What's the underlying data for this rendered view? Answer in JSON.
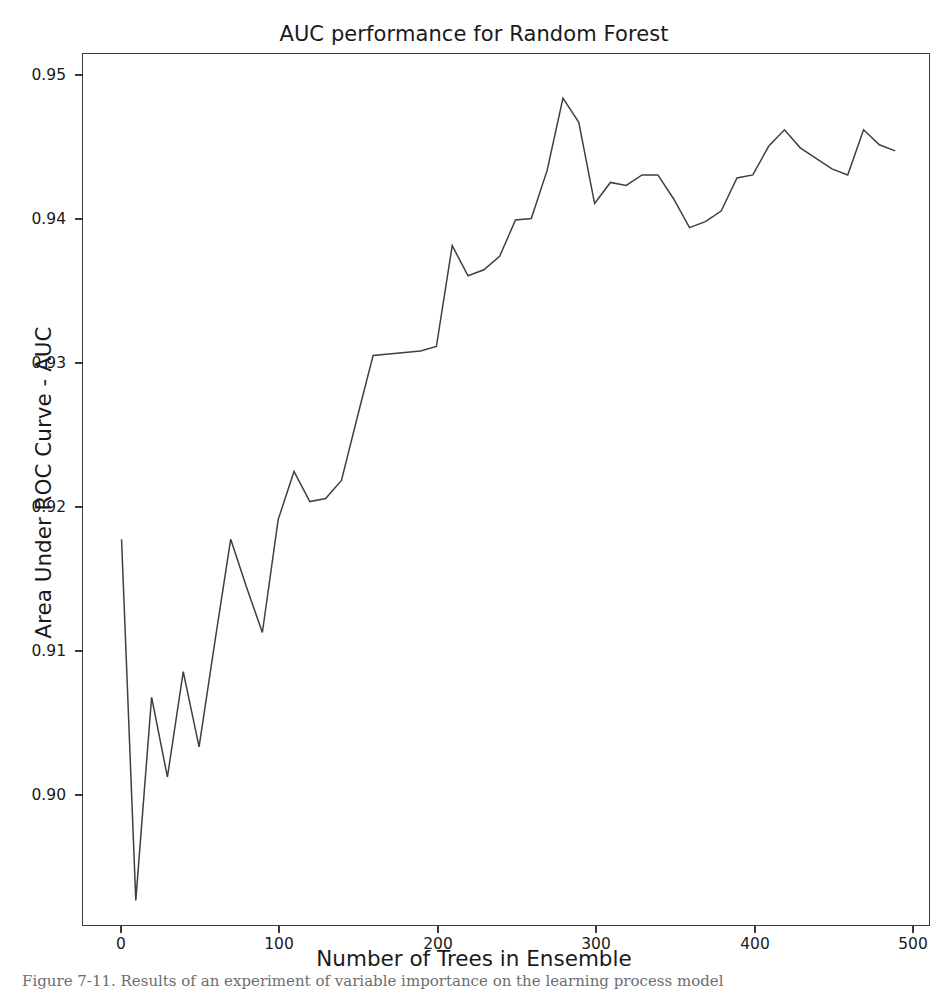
{
  "figure": {
    "title": "AUC performance for Random Forest",
    "background_color": "#ffffff",
    "line_color": "#3f3f3f",
    "axis_color": "#3a3a3a",
    "text_color": "#1a1a1a"
  },
  "chart_data": {
    "type": "line",
    "title": "AUC performance for Random Forest",
    "xlabel": "Number of Trees in Ensemble",
    "ylabel": "Area Under ROC Curve - AUC",
    "xlim": [
      -24,
      512
    ],
    "ylim": [
      0.8938,
      0.9518
    ],
    "xticks": [
      0,
      100,
      200,
      300,
      400,
      500
    ],
    "xtick_labels": [
      "0",
      "100",
      "200",
      "300",
      "400",
      "500"
    ],
    "yticks": [
      0.9,
      0.91,
      0.92,
      0.93,
      0.94,
      0.95
    ],
    "ytick_labels": [
      "0.90",
      "0.91",
      "0.92",
      "0.93",
      "0.94",
      "0.95"
    ],
    "grid": false,
    "legend": null,
    "series": [
      {
        "name": "Random Forest AUC",
        "color": "#3f3f3f",
        "linewidth": 1.5,
        "x": [
          1,
          10,
          20,
          30,
          40,
          50,
          60,
          70,
          80,
          90,
          100,
          110,
          120,
          130,
          140,
          150,
          160,
          170,
          180,
          190,
          200,
          210,
          220,
          230,
          240,
          250,
          260,
          270,
          280,
          290,
          300,
          310,
          320,
          330,
          340,
          350,
          360,
          370,
          380,
          390,
          400,
          410,
          420,
          430,
          440,
          450,
          460,
          470,
          480,
          490
        ],
        "y": [
          0.9195,
          0.8955,
          0.909,
          0.9037,
          0.9107,
          0.9057,
          0.9127,
          0.9195,
          0.9163,
          0.9133,
          0.9208,
          0.924,
          0.922,
          0.9222,
          0.9234,
          0.9276,
          0.9317,
          0.9318,
          0.9319,
          0.932,
          0.9323,
          0.939,
          0.937,
          0.9374,
          0.9383,
          0.9407,
          0.9408,
          0.944,
          0.9488,
          0.9472,
          0.9418,
          0.9432,
          0.943,
          0.9437,
          0.9437,
          0.9421,
          0.9402,
          0.9406,
          0.9413,
          0.9435,
          0.9437,
          0.9456,
          0.9467,
          0.9455,
          0.9448,
          0.9441,
          0.9437,
          0.9467,
          0.9457,
          0.9453
        ]
      }
    ],
    "max_point": {
      "x": 280,
      "y": 0.9488
    },
    "min_point": {
      "x": 10,
      "y": 0.8955
    },
    "start_point": {
      "x": 1,
      "y": 0.9195
    },
    "end_point": {
      "x": 490,
      "y": 0.9453
    }
  },
  "axes": {
    "xlabel": "Number of Trees in Ensemble",
    "ylabel": "Area Under ROC Curve - AUC"
  },
  "caption": {
    "text": "Figure 7-11. Results of an experiment of variable importance on the learning process model"
  }
}
